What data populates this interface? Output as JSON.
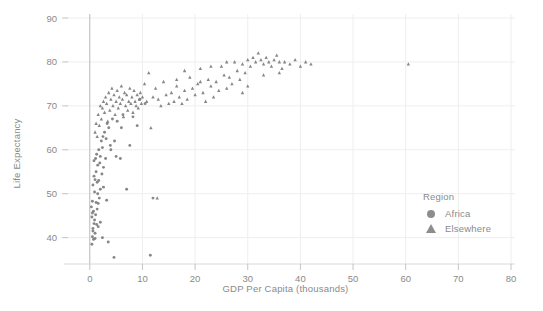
{
  "chart_data": {
    "type": "scatter",
    "title": "",
    "xlabel": "GDP Per Capita (thousands)",
    "ylabel": "Life Expectancy",
    "xlim": [
      -3,
      80
    ],
    "ylim": [
      34,
      90
    ],
    "xticks": [
      0,
      10,
      20,
      30,
      40,
      50,
      60,
      70,
      80
    ],
    "yticks": [
      40,
      50,
      60,
      70,
      80,
      90
    ],
    "grid": true,
    "legend": {
      "title": "Region",
      "position": "right-inside",
      "entries": [
        {
          "label": "Africa",
          "marker": "circle",
          "color": "#8d8d8d"
        },
        {
          "label": "Elsewhere",
          "marker": "triangle",
          "color": "#8d8d8d"
        }
      ]
    },
    "marker_color": "#7d7d7d",
    "series": [
      {
        "name": "Africa",
        "marker": "circle",
        "points": [
          [
            0.3,
            47.0
          ],
          [
            0.4,
            44.7
          ],
          [
            0.5,
            45.6
          ],
          [
            0.5,
            48.3
          ],
          [
            0.6,
            42.1
          ],
          [
            0.6,
            52.0
          ],
          [
            0.7,
            39.6
          ],
          [
            0.7,
            46.0
          ],
          [
            0.8,
            54.0
          ],
          [
            0.8,
            57.5
          ],
          [
            0.9,
            44.0
          ],
          [
            0.9,
            50.4
          ],
          [
            1.0,
            41.0
          ],
          [
            1.0,
            53.2
          ],
          [
            1.1,
            45.2
          ],
          [
            1.1,
            58.0
          ],
          [
            1.2,
            48.0
          ],
          [
            1.2,
            55.0
          ],
          [
            1.3,
            43.0
          ],
          [
            1.3,
            59.0
          ],
          [
            1.4,
            52.6
          ],
          [
            1.4,
            46.5
          ],
          [
            1.5,
            56.5
          ],
          [
            1.5,
            50.0
          ],
          [
            1.6,
            47.8
          ],
          [
            1.7,
            60.0
          ],
          [
            1.7,
            53.0
          ],
          [
            1.8,
            49.0
          ],
          [
            1.9,
            57.0
          ],
          [
            2.0,
            51.0
          ],
          [
            2.0,
            58.5
          ],
          [
            2.2,
            62.0
          ],
          [
            2.3,
            54.5
          ],
          [
            2.4,
            60.5
          ],
          [
            2.5,
            63.0
          ],
          [
            2.6,
            56.0
          ],
          [
            2.8,
            64.0
          ],
          [
            3.0,
            58.0
          ],
          [
            3.1,
            62.5
          ],
          [
            3.3,
            66.0
          ],
          [
            3.6,
            65.0
          ],
          [
            3.9,
            61.0
          ],
          [
            4.3,
            67.0
          ],
          [
            4.7,
            62.0
          ],
          [
            5.2,
            66.5
          ],
          [
            5.8,
            58.0
          ],
          [
            6.3,
            68.0
          ],
          [
            7.0,
            51.0
          ],
          [
            7.6,
            61.0
          ],
          [
            8.2,
            67.5
          ],
          [
            9.0,
            65.5
          ],
          [
            11.5,
            36.0
          ],
          [
            12.0,
            49.0
          ],
          [
            4.6,
            35.5
          ],
          [
            0.4,
            38.5
          ],
          [
            0.5,
            40.2
          ],
          [
            0.6,
            41.5
          ],
          [
            1.0,
            39.8
          ],
          [
            2.4,
            40.0
          ],
          [
            3.5,
            39.0
          ],
          [
            5.0,
            58.5
          ],
          [
            4.0,
            60.0
          ],
          [
            6.0,
            65.0
          ],
          [
            2.0,
            43.5
          ],
          [
            1.6,
            42.5
          ],
          [
            0.8,
            43.2
          ],
          [
            9.5,
            71.5
          ],
          [
            10.5,
            70.5
          ],
          [
            3.2,
            48.5
          ],
          [
            2.6,
            51.5
          ]
        ]
      },
      {
        "name": "Elsewhere",
        "marker": "triangle",
        "points": [
          [
            1.0,
            64.0
          ],
          [
            1.2,
            66.0
          ],
          [
            1.4,
            63.0
          ],
          [
            1.6,
            68.0
          ],
          [
            1.8,
            65.5
          ],
          [
            2.0,
            70.0
          ],
          [
            2.2,
            67.0
          ],
          [
            2.4,
            69.5
          ],
          [
            2.6,
            71.0
          ],
          [
            2.8,
            68.5
          ],
          [
            3.0,
            72.0
          ],
          [
            3.2,
            70.5
          ],
          [
            3.4,
            66.5
          ],
          [
            3.6,
            73.0
          ],
          [
            3.8,
            69.0
          ],
          [
            4.0,
            71.5
          ],
          [
            4.2,
            74.0
          ],
          [
            4.4,
            70.0
          ],
          [
            4.6,
            72.5
          ],
          [
            4.8,
            68.0
          ],
          [
            5.0,
            71.0
          ],
          [
            5.2,
            73.5
          ],
          [
            5.4,
            69.5
          ],
          [
            5.6,
            72.0
          ],
          [
            5.8,
            70.5
          ],
          [
            6.0,
            74.5
          ],
          [
            6.2,
            71.5
          ],
          [
            6.4,
            67.5
          ],
          [
            6.6,
            73.0
          ],
          [
            6.8,
            70.0
          ],
          [
            7.0,
            72.5
          ],
          [
            7.2,
            69.0
          ],
          [
            7.4,
            71.0
          ],
          [
            7.6,
            74.0
          ],
          [
            7.8,
            70.5
          ],
          [
            8.0,
            72.0
          ],
          [
            8.2,
            68.5
          ],
          [
            8.4,
            73.5
          ],
          [
            8.6,
            71.0
          ],
          [
            8.8,
            70.0
          ],
          [
            9.0,
            72.5
          ],
          [
            9.2,
            69.5
          ],
          [
            9.4,
            71.5
          ],
          [
            9.6,
            73.0
          ],
          [
            9.8,
            70.5
          ],
          [
            10.0,
            72.0
          ],
          [
            10.4,
            75.0
          ],
          [
            10.8,
            71.0
          ],
          [
            11.2,
            77.5
          ],
          [
            11.6,
            65.0
          ],
          [
            12.0,
            72.0
          ],
          [
            12.5,
            74.0
          ],
          [
            13.0,
            71.5
          ],
          [
            13.5,
            70.0
          ],
          [
            14.0,
            75.5
          ],
          [
            14.5,
            72.5
          ],
          [
            15.0,
            70.5
          ],
          [
            15.5,
            73.0
          ],
          [
            16.0,
            71.0
          ],
          [
            16.5,
            74.5
          ],
          [
            17.0,
            72.0
          ],
          [
            17.5,
            70.5
          ],
          [
            18.0,
            73.5
          ],
          [
            18.5,
            71.5
          ],
          [
            19.0,
            76.5
          ],
          [
            19.5,
            74.0
          ],
          [
            20.0,
            72.5
          ],
          [
            20.5,
            75.0
          ],
          [
            21.0,
            78.5
          ],
          [
            21.5,
            73.0
          ],
          [
            22.0,
            71.0
          ],
          [
            22.5,
            76.0
          ],
          [
            23.0,
            74.5
          ],
          [
            23.5,
            72.0
          ],
          [
            24.0,
            75.5
          ],
          [
            24.5,
            73.5
          ],
          [
            25.0,
            79.0
          ],
          [
            25.5,
            77.0
          ],
          [
            26.0,
            74.0
          ],
          [
            26.5,
            76.5
          ],
          [
            27.0,
            75.0
          ],
          [
            27.5,
            80.0
          ],
          [
            28.0,
            78.0
          ],
          [
            28.5,
            76.0
          ],
          [
            29.0,
            79.5
          ],
          [
            29.5,
            77.5
          ],
          [
            30.0,
            80.5
          ],
          [
            30.5,
            79.0
          ],
          [
            31.0,
            81.0
          ],
          [
            31.5,
            80.0
          ],
          [
            32.0,
            82.0
          ],
          [
            32.5,
            80.5
          ],
          [
            33.0,
            79.5
          ],
          [
            33.5,
            81.0
          ],
          [
            34.0,
            80.0
          ],
          [
            34.5,
            79.0
          ],
          [
            35.0,
            80.5
          ],
          [
            35.5,
            81.5
          ],
          [
            36.0,
            80.0
          ],
          [
            36.5,
            78.5
          ],
          [
            37.0,
            80.0
          ],
          [
            38.0,
            79.5
          ],
          [
            39.0,
            80.5
          ],
          [
            40.0,
            79.0
          ],
          [
            41.0,
            80.0
          ],
          [
            42.0,
            79.5
          ],
          [
            60.5,
            79.5
          ],
          [
            12.8,
            49.0
          ],
          [
            18.0,
            78.0
          ],
          [
            23.0,
            79.0
          ],
          [
            29.0,
            73.0
          ],
          [
            33.0,
            77.0
          ],
          [
            16.5,
            76.0
          ],
          [
            21.0,
            75.5
          ],
          [
            26.0,
            80.0
          ],
          [
            30.0,
            74.5
          ],
          [
            36.0,
            77.5
          ]
        ]
      }
    ]
  },
  "axes": {
    "xtick_labels": [
      "0",
      "10",
      "20",
      "30",
      "40",
      "50",
      "60",
      "70",
      "80"
    ],
    "ytick_labels": [
      "40",
      "50",
      "60",
      "70",
      "80",
      "90"
    ]
  }
}
